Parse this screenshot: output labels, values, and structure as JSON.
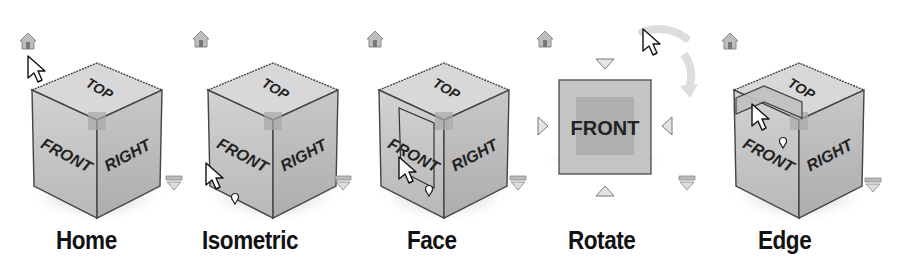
{
  "viewcube_states": [
    {
      "id": "home",
      "label": "Home",
      "cursor_target": "home-button"
    },
    {
      "id": "isometric",
      "label": "Isometric",
      "cursor_target": "front-bottom-corner"
    },
    {
      "id": "face",
      "label": "Face",
      "cursor_target": "front-face"
    },
    {
      "id": "rotate",
      "label": "Rotate",
      "cursor_target": "rotate-arrow"
    },
    {
      "id": "edge",
      "label": "Edge",
      "cursor_target": "top-front-edge"
    }
  ],
  "cube_faces": {
    "top": "TOP",
    "front": "FRONT",
    "right": "RIGHT"
  },
  "colors": {
    "face_fill": "#c8c8c8",
    "top_fill": "#d6d6d6",
    "right_fill": "#bdbdbd",
    "outline": "#444444",
    "highlight": "#a8a8a8",
    "icon_gray": "#9a9a9a",
    "label": "#111111"
  }
}
